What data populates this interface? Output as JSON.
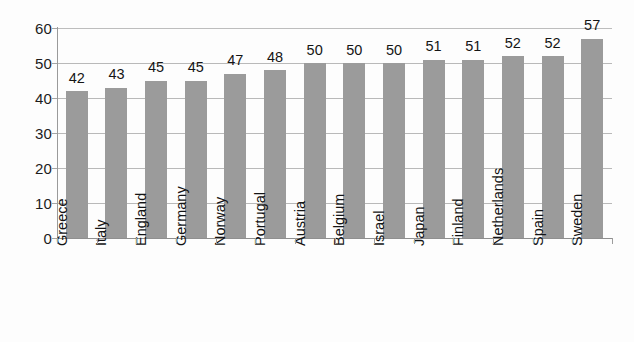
{
  "chart_data": {
    "type": "bar",
    "title": "",
    "subtitle": "",
    "xlabel": "",
    "ylabel": "",
    "categories": [
      "Greece",
      "Italy",
      "England",
      "Germany",
      "Norway",
      "Portugal",
      "Austria",
      "Belgium",
      "Israel",
      "Japan",
      "Finland",
      "Netherlands",
      "Spain",
      "Sweden"
    ],
    "values": [
      42,
      43,
      45,
      45,
      47,
      48,
      50,
      50,
      50,
      51,
      51,
      52,
      52,
      57
    ],
    "value_labels": [
      "42",
      "43",
      "45",
      "45",
      "47",
      "48",
      "50",
      "50",
      "50",
      "51",
      "51",
      "52",
      "52",
      "57"
    ],
    "ylim": [
      0,
      60
    ],
    "y_ticks": [
      0,
      10,
      20,
      30,
      40,
      50,
      60
    ],
    "y_tick_labels": [
      "0",
      "10",
      "20",
      "30",
      "40",
      "50",
      "60"
    ],
    "grid": true,
    "grid_axis": "y",
    "legend": false,
    "legend_position": "none",
    "series": [
      {
        "name": "",
        "values": [
          42,
          43,
          45,
          45,
          47,
          48,
          50,
          50,
          50,
          51,
          51,
          52,
          52,
          57
        ],
        "color": "#9b9b9b"
      }
    ],
    "colors": {
      "bar": "#9b9b9b",
      "grid": "#b9b9b9",
      "axis": "#8f8f8f",
      "text": "#1a1a1a",
      "background": "#fdfdfd"
    }
  }
}
